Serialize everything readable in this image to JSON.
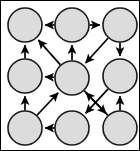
{
  "figure": {
    "width": 140,
    "height": 151,
    "background_color": "#ffffff",
    "frame_color": "#000000",
    "node_fill_color": "#dcdcdc",
    "node_stroke_color": "#1a1a1a",
    "edge_color": "#000000",
    "node_radius": 17
  },
  "chart_data": {
    "type": "diagram",
    "xlabel": "",
    "ylabel": "",
    "nodes": [
      {
        "id": "n1",
        "label": "",
        "row": 0,
        "col": 0,
        "x": 25,
        "y": 25
      },
      {
        "id": "n2",
        "label": "",
        "row": 0,
        "col": 1,
        "x": 72,
        "y": 25
      },
      {
        "id": "n3",
        "label": "",
        "row": 0,
        "col": 2,
        "x": 120,
        "y": 25
      },
      {
        "id": "n4",
        "label": "",
        "row": 1,
        "col": 0,
        "x": 25,
        "y": 76
      },
      {
        "id": "n5",
        "label": "",
        "row": 1,
        "col": 1,
        "x": 72,
        "y": 78
      },
      {
        "id": "n6",
        "label": "",
        "row": 1,
        "col": 2,
        "x": 120,
        "y": 76
      },
      {
        "id": "n7",
        "label": "",
        "row": 2,
        "col": 0,
        "x": 25,
        "y": 128
      },
      {
        "id": "n8",
        "label": "",
        "row": 2,
        "col": 1,
        "x": 72,
        "y": 128
      },
      {
        "id": "n9",
        "label": "",
        "row": 2,
        "col": 2,
        "x": 120,
        "y": 128
      }
    ],
    "edges": [
      {
        "from": "n2",
        "to": "n1",
        "directed": true
      },
      {
        "from": "n2",
        "to": "n3",
        "directed": true
      },
      {
        "from": "n3",
        "to": "n5",
        "directed": true
      },
      {
        "from": "n3",
        "to": "n6",
        "directed": true
      },
      {
        "from": "n4",
        "to": "n1",
        "directed": true
      },
      {
        "from": "n5",
        "to": "n1",
        "directed": true
      },
      {
        "from": "n5",
        "to": "n2",
        "directed": true
      },
      {
        "from": "n5",
        "to": "n4",
        "directed": true
      },
      {
        "from": "n5",
        "to": "n9",
        "directed": true
      },
      {
        "from": "n7",
        "to": "n4",
        "directed": true
      },
      {
        "from": "n7",
        "to": "n5",
        "directed": true
      },
      {
        "from": "n8",
        "to": "n7",
        "directed": true
      },
      {
        "from": "n9",
        "to": "n5",
        "directed": true
      },
      {
        "from": "n9",
        "to": "n6",
        "directed": true
      },
      {
        "from": "n6",
        "to": "n8",
        "directed": true
      }
    ],
    "node_count": 9,
    "edge_count": 15,
    "legend": [],
    "annotations": []
  }
}
